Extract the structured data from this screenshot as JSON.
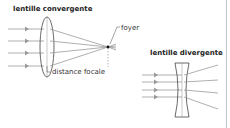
{
  "converging": {
    "title": "lentille convergente",
    "focus_label": "foyer",
    "focal_distance_label": "distance focale"
  },
  "diverging": {
    "title": "lentille divergente"
  },
  "colors": {
    "ray": "#9a9a9a",
    "lens": "#444444",
    "focus": "#111111",
    "border": "#bdbdbd"
  }
}
